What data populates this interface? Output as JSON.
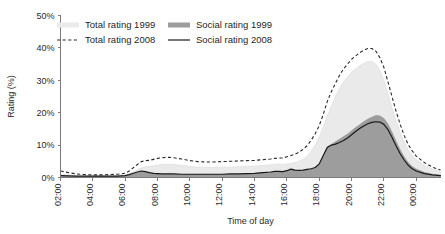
{
  "chart_data": {
    "type": "area",
    "title": "",
    "xlabel": "Time of day",
    "ylabel": "Rating (%)",
    "ylim": [
      0,
      50
    ],
    "ytick_labels": [
      "0%",
      "10%",
      "20%",
      "30%",
      "40%",
      "50%"
    ],
    "ytick_values": [
      0,
      10,
      20,
      30,
      40,
      50
    ],
    "xtick_labels": [
      "02:00",
      "04:00",
      "06:00",
      "08:00",
      "10:00",
      "12:00",
      "14:00",
      "16:00",
      "18:00",
      "20:00",
      "22:00",
      "00:00"
    ],
    "xtick_values": [
      2,
      4,
      6,
      8,
      10,
      12,
      14,
      16,
      18,
      20,
      22,
      24
    ],
    "xlim": [
      2,
      25.5
    ],
    "grid": false,
    "legend_position": "top-left",
    "legend": [
      {
        "label": "Total rating 1999",
        "marker": "area-light",
        "color": "#eaeaea"
      },
      {
        "label": "Social rating 1999",
        "marker": "area-dark",
        "color": "#9d9d9d"
      },
      {
        "label": "Total rating 2008",
        "marker": "dashed-line",
        "color": "#2a2a2a"
      },
      {
        "label": "Social rating 2008",
        "marker": "solid-line",
        "color": "#1a1a1a"
      }
    ],
    "x": [
      2.0,
      2.5,
      3.0,
      3.5,
      4.0,
      4.5,
      5.0,
      5.5,
      6.0,
      6.25,
      6.5,
      6.75,
      7.0,
      7.25,
      7.5,
      7.75,
      8.0,
      8.25,
      8.5,
      8.75,
      9.0,
      9.5,
      10.0,
      10.5,
      11.0,
      11.5,
      12.0,
      12.5,
      13.0,
      13.5,
      14.0,
      14.5,
      15.0,
      15.25,
      15.5,
      15.75,
      16.0,
      16.25,
      16.5,
      16.75,
      17.0,
      17.25,
      17.5,
      17.75,
      18.0,
      18.25,
      18.5,
      18.75,
      19.0,
      19.25,
      19.5,
      19.75,
      20.0,
      20.25,
      20.5,
      20.75,
      21.0,
      21.25,
      21.5,
      21.75,
      22.0,
      22.25,
      22.5,
      22.75,
      23.0,
      23.25,
      23.5,
      23.75,
      24.0,
      24.5,
      25.0,
      25.5
    ],
    "series": [
      {
        "name": "Total rating 1999",
        "type": "area",
        "values": [
          1.0,
          0.8,
          0.6,
          0.5,
          0.5,
          0.5,
          0.5,
          0.6,
          0.8,
          1.2,
          1.8,
          2.4,
          3.0,
          3.3,
          3.4,
          3.6,
          3.8,
          4.0,
          4.1,
          4.1,
          4.0,
          3.8,
          3.4,
          3.2,
          3.1,
          3.1,
          3.2,
          3.2,
          3.3,
          3.4,
          3.5,
          3.7,
          3.9,
          4.1,
          4.2,
          4.0,
          4.2,
          4.3,
          4.6,
          5.0,
          5.6,
          6.5,
          8.0,
          10.0,
          12.5,
          15.5,
          19.0,
          22.0,
          25.0,
          27.5,
          29.5,
          31.0,
          32.5,
          33.5,
          34.5,
          35.2,
          35.8,
          35.8,
          35.0,
          33.0,
          30.0,
          26.0,
          21.5,
          17.5,
          14.0,
          11.0,
          8.5,
          6.8,
          5.5,
          3.8,
          2.6,
          1.8
        ]
      },
      {
        "name": "Social rating 1999",
        "type": "area",
        "values": [
          0.4,
          0.35,
          0.3,
          0.3,
          0.3,
          0.3,
          0.3,
          0.35,
          0.5,
          0.8,
          1.2,
          1.6,
          1.9,
          1.7,
          1.4,
          1.2,
          1.1,
          1.0,
          1.0,
          1.0,
          1.0,
          0.9,
          0.9,
          0.9,
          0.9,
          0.9,
          0.9,
          1.0,
          1.0,
          1.1,
          1.2,
          1.4,
          1.6,
          1.8,
          1.8,
          1.7,
          2.0,
          2.5,
          2.2,
          2.1,
          2.2,
          2.4,
          2.6,
          3.0,
          4.0,
          6.5,
          9.0,
          10.2,
          11.0,
          11.8,
          12.6,
          13.4,
          14.4,
          15.4,
          16.3,
          17.2,
          18.0,
          18.6,
          19.1,
          19.0,
          18.2,
          16.5,
          14.0,
          11.2,
          8.6,
          6.4,
          4.6,
          3.4,
          2.6,
          1.6,
          1.0,
          0.7
        ]
      },
      {
        "name": "Total rating 2008",
        "type": "line",
        "values": [
          2.0,
          1.5,
          1.1,
          0.9,
          0.8,
          0.8,
          0.9,
          1.0,
          1.3,
          2.0,
          3.0,
          4.0,
          4.9,
          5.2,
          5.3,
          5.6,
          5.9,
          6.1,
          6.2,
          6.2,
          6.1,
          5.7,
          5.2,
          4.9,
          4.8,
          4.8,
          4.9,
          5.0,
          5.1,
          5.2,
          5.3,
          5.5,
          5.7,
          5.9,
          6.0,
          6.0,
          6.4,
          6.8,
          7.2,
          7.8,
          8.7,
          9.8,
          11.5,
          13.5,
          16.0,
          19.5,
          23.5,
          26.5,
          29.0,
          31.5,
          33.5,
          35.0,
          36.5,
          37.5,
          38.5,
          39.3,
          39.8,
          39.8,
          39.0,
          37.0,
          34.0,
          29.5,
          25.0,
          20.5,
          16.5,
          13.0,
          10.2,
          8.2,
          6.6,
          4.6,
          3.2,
          2.3
        ]
      },
      {
        "name": "Social rating 2008",
        "type": "line",
        "values": [
          0.6,
          0.5,
          0.4,
          0.4,
          0.4,
          0.4,
          0.4,
          0.45,
          0.6,
          0.9,
          1.3,
          1.7,
          2.0,
          1.8,
          1.5,
          1.3,
          1.2,
          1.1,
          1.1,
          1.1,
          1.1,
          1.0,
          1.0,
          1.0,
          1.0,
          1.0,
          1.0,
          1.1,
          1.1,
          1.2,
          1.3,
          1.5,
          1.7,
          1.9,
          1.9,
          1.8,
          2.1,
          2.6,
          2.3,
          2.2,
          2.3,
          2.5,
          2.7,
          3.1,
          4.2,
          6.8,
          9.3,
          10.0,
          10.3,
          10.8,
          11.4,
          12.2,
          13.2,
          14.2,
          15.1,
          15.9,
          16.6,
          17.0,
          17.2,
          17.1,
          16.4,
          14.8,
          12.4,
          9.8,
          7.4,
          5.4,
          3.8,
          2.7,
          2.0,
          1.2,
          0.8,
          0.6
        ]
      }
    ]
  }
}
